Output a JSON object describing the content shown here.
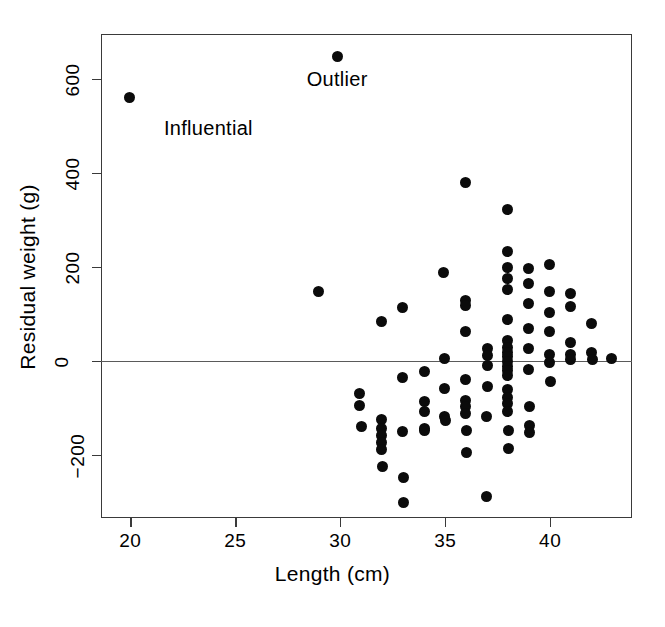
{
  "chart_data": {
    "type": "scatter",
    "title": "",
    "xlabel": "Length (cm)",
    "ylabel": "Residual weight (g)",
    "xlim": [
      18.6,
      43.9
    ],
    "ylim": [
      -335,
      695
    ],
    "xticks": [
      20,
      25,
      30,
      35,
      40
    ],
    "xticklabels": [
      "20",
      "25",
      "30",
      "35",
      "40"
    ],
    "yticks": [
      -200,
      0,
      200,
      400,
      600
    ],
    "yticklabels": [
      "-200",
      "0",
      "200",
      "400",
      "600"
    ],
    "grid": false,
    "legend": null,
    "reference_lines": [
      {
        "orientation": "horizontal",
        "y": 0
      }
    ],
    "marker": {
      "shape": "circle",
      "color": "#0b0b0b",
      "size": 11
    },
    "annotations": [
      {
        "text": "Influential",
        "x": 21.6,
        "y": 490
      },
      {
        "text": "Outlier",
        "x": 28.4,
        "y": 595
      }
    ],
    "points": [
      {
        "x": 19.95,
        "y": 560,
        "label": "Influential"
      },
      {
        "x": 29.85,
        "y": 648,
        "label": "Outlier"
      },
      {
        "x": 28.95,
        "y": 148
      },
      {
        "x": 30.9,
        "y": -70
      },
      {
        "x": 30.9,
        "y": -95
      },
      {
        "x": 31.0,
        "y": -140
      },
      {
        "x": 31.95,
        "y": 83
      },
      {
        "x": 31.95,
        "y": -125
      },
      {
        "x": 31.95,
        "y": -145
      },
      {
        "x": 31.95,
        "y": -160
      },
      {
        "x": 31.95,
        "y": -175
      },
      {
        "x": 31.95,
        "y": -190
      },
      {
        "x": 32.0,
        "y": -225
      },
      {
        "x": 32.95,
        "y": 112
      },
      {
        "x": 32.95,
        "y": -35
      },
      {
        "x": 32.95,
        "y": -150
      },
      {
        "x": 33.0,
        "y": -248
      },
      {
        "x": 33.0,
        "y": -302
      },
      {
        "x": 34.0,
        "y": -23
      },
      {
        "x": 34.0,
        "y": -88
      },
      {
        "x": 34.0,
        "y": -108
      },
      {
        "x": 34.0,
        "y": -145
      },
      {
        "x": 34.0,
        "y": -148
      },
      {
        "x": 34.9,
        "y": 188
      },
      {
        "x": 34.95,
        "y": 5
      },
      {
        "x": 34.95,
        "y": -60
      },
      {
        "x": 34.95,
        "y": -118
      },
      {
        "x": 35.0,
        "y": -128
      },
      {
        "x": 35.95,
        "y": 378
      },
      {
        "x": 35.95,
        "y": 128
      },
      {
        "x": 35.95,
        "y": 118
      },
      {
        "x": 35.95,
        "y": 62
      },
      {
        "x": 35.95,
        "y": -40
      },
      {
        "x": 35.95,
        "y": -85
      },
      {
        "x": 35.95,
        "y": -98
      },
      {
        "x": 35.95,
        "y": -112
      },
      {
        "x": 36.0,
        "y": -148
      },
      {
        "x": 36.0,
        "y": -195
      },
      {
        "x": 36.95,
        "y": -118
      },
      {
        "x": 36.95,
        "y": -290
      },
      {
        "x": 37.0,
        "y": 25
      },
      {
        "x": 37.0,
        "y": 10
      },
      {
        "x": 37.0,
        "y": -10
      },
      {
        "x": 37.0,
        "y": -55
      },
      {
        "x": 37.95,
        "y": 322
      },
      {
        "x": 37.95,
        "y": 232
      },
      {
        "x": 37.95,
        "y": 198
      },
      {
        "x": 37.95,
        "y": 175
      },
      {
        "x": 37.95,
        "y": 152
      },
      {
        "x": 37.95,
        "y": 88
      },
      {
        "x": 37.95,
        "y": 42
      },
      {
        "x": 37.95,
        "y": 28
      },
      {
        "x": 37.95,
        "y": 18
      },
      {
        "x": 37.95,
        "y": 8
      },
      {
        "x": 37.95,
        "y": -2
      },
      {
        "x": 37.95,
        "y": -12
      },
      {
        "x": 37.95,
        "y": -22
      },
      {
        "x": 37.95,
        "y": -32
      },
      {
        "x": 37.95,
        "y": -62
      },
      {
        "x": 37.95,
        "y": -78
      },
      {
        "x": 37.95,
        "y": -92
      },
      {
        "x": 37.95,
        "y": -108
      },
      {
        "x": 38.0,
        "y": -148
      },
      {
        "x": 38.0,
        "y": -188
      },
      {
        "x": 38.95,
        "y": 195
      },
      {
        "x": 38.95,
        "y": 165
      },
      {
        "x": 38.95,
        "y": 122
      },
      {
        "x": 38.95,
        "y": 68
      },
      {
        "x": 38.95,
        "y": 25
      },
      {
        "x": 38.95,
        "y": -18
      },
      {
        "x": 39.0,
        "y": -98
      },
      {
        "x": 39.0,
        "y": -138
      },
      {
        "x": 39.0,
        "y": -152
      },
      {
        "x": 39.95,
        "y": 205
      },
      {
        "x": 39.95,
        "y": 148
      },
      {
        "x": 39.95,
        "y": 102
      },
      {
        "x": 39.95,
        "y": 62
      },
      {
        "x": 39.95,
        "y": 12
      },
      {
        "x": 39.95,
        "y": -5
      },
      {
        "x": 40.0,
        "y": -45
      },
      {
        "x": 40.95,
        "y": 142
      },
      {
        "x": 40.95,
        "y": 115
      },
      {
        "x": 40.95,
        "y": 38
      },
      {
        "x": 40.95,
        "y": 12
      },
      {
        "x": 40.95,
        "y": 2
      },
      {
        "x": 41.95,
        "y": 78
      },
      {
        "x": 41.95,
        "y": 18
      },
      {
        "x": 42.0,
        "y": 2
      },
      {
        "x": 42.9,
        "y": 5
      }
    ]
  }
}
